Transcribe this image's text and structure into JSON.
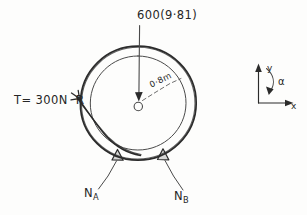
{
  "diagram": {
    "ink_color": "#2b2b2b",
    "background_color": "#fdfdfc"
  },
  "labels": {
    "weight_force": "600(9·81)",
    "tension": "T= 300N",
    "tension_point": "R",
    "radius": "0·8m",
    "center": "O",
    "reaction_a_main": "N",
    "reaction_a_sub": "A",
    "reaction_b_main": "N",
    "reaction_b_sub": "B"
  },
  "axes": {
    "y_label": "y",
    "x_label": "x",
    "angle_label": "α"
  },
  "geometry": {
    "center_x": 138,
    "center_y": 104,
    "outer_radius": 58,
    "inner_radius": 48,
    "weight_arrow_top_y": 25,
    "support_a_x": 117,
    "support_b_x": 163,
    "axes_origin_x": 258,
    "axes_origin_y": 103
  }
}
